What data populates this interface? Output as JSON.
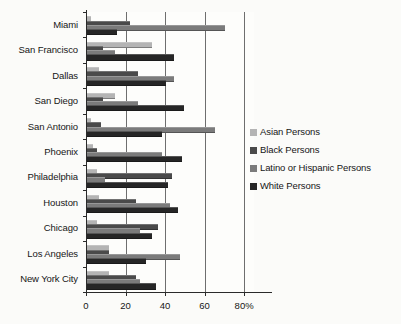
{
  "chart_data": {
    "type": "bar",
    "orientation": "horizontal",
    "title": "",
    "xlabel": "",
    "ylabel": "",
    "xlim": [
      0,
      85
    ],
    "xticks": [
      0,
      20,
      40,
      60,
      80
    ],
    "xtick_labels": [
      "0",
      "20",
      "40",
      "60",
      "80%"
    ],
    "grid": true,
    "grid_axis": "x",
    "legend_position": "right",
    "categories": [
      "Miami",
      "San Francisco",
      "Dallas",
      "San Diego",
      "San Antonio",
      "Phoenix",
      "Philadelphia",
      "Houston",
      "Chicago",
      "Los Angeles",
      "New York City"
    ],
    "series": [
      {
        "name": "Asian Persons",
        "color": "#b4b4b4",
        "values": [
          2,
          33,
          6,
          14,
          2,
          3,
          5,
          6,
          5,
          11,
          11
        ]
      },
      {
        "name": "Black Persons",
        "color": "#4a4a4a",
        "values": [
          22,
          8,
          26,
          8,
          7,
          5,
          43,
          25,
          36,
          11,
          25
        ]
      },
      {
        "name": "Latino or Hispanic Persons",
        "color": "#7b7b7b",
        "values": [
          70,
          14,
          44,
          26,
          65,
          38,
          9,
          42,
          27,
          47,
          27
        ]
      },
      {
        "name": "White Persons",
        "color": "#262626",
        "values": [
          15,
          44,
          40,
          49,
          38,
          48,
          41,
          46,
          33,
          30,
          35
        ]
      }
    ]
  },
  "legend": {
    "items": [
      {
        "label": "Asian Persons",
        "color": "#b4b4b4"
      },
      {
        "label": "Black Persons",
        "color": "#4a4a4a"
      },
      {
        "label": "Latino or Hispanic Persons",
        "color": "#7b7b7b"
      },
      {
        "label": "White Persons",
        "color": "#262626"
      }
    ]
  }
}
